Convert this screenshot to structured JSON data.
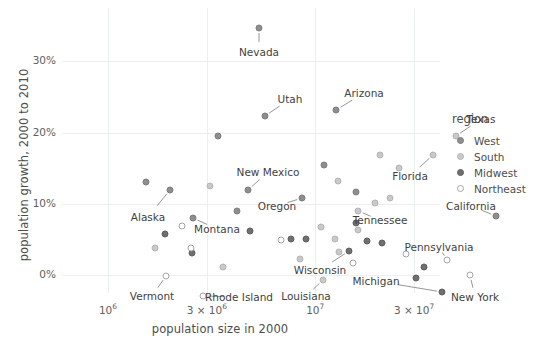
{
  "chart_data": {
    "type": "scatter",
    "title": "",
    "xlabel": "population size in 2000",
    "ylabel": "population growth, 2000 to 2010",
    "xscale": "log",
    "xlim": [
      600000,
      40000000
    ],
    "ylim": [
      -0.025,
      0.375
    ],
    "grid": true,
    "xticks": [
      {
        "value": 1000000,
        "label": "10",
        "exp": "6"
      },
      {
        "value": 3000000,
        "label": "3 × 10",
        "exp": "6"
      },
      {
        "value": 10000000,
        "label": "10",
        "exp": "7"
      },
      {
        "value": 30000000,
        "label": "3 × 10",
        "exp": "7"
      }
    ],
    "yticks": [
      {
        "value": 0.0,
        "label": "0%"
      },
      {
        "value": 0.1,
        "label": "10%"
      },
      {
        "value": 0.2,
        "label": "20%"
      },
      {
        "value": 0.3,
        "label": "30%"
      }
    ],
    "legend": {
      "title": "region",
      "position": "right",
      "entries": [
        {
          "label": "West",
          "color": "#8e8e8e",
          "key": "west"
        },
        {
          "label": "South",
          "color": "#c9c9c9",
          "key": "south"
        },
        {
          "label": "Midwest",
          "color": "#6f6f6f",
          "key": "midwest"
        },
        {
          "label": "Northeast",
          "color": "#ffffff",
          "key": "northeast"
        }
      ]
    },
    "points": [
      {
        "name": "Nevada",
        "region": "west",
        "px": 197,
        "py": 20,
        "labeled": true,
        "lx": 197,
        "ly": 44,
        "anchor": "center"
      },
      {
        "name": "Utah",
        "region": "west",
        "px": 203,
        "py": 108,
        "labeled": true,
        "lx": 228,
        "ly": 91,
        "anchor": "left"
      },
      {
        "name": "Arizona",
        "region": "west",
        "px": 274,
        "py": 102,
        "labeled": true,
        "lx": 302,
        "ly": 85,
        "anchor": "left"
      },
      {
        "name": "Texas",
        "region": "south",
        "px": 394,
        "py": 128,
        "labeled": true,
        "lx": 419,
        "ly": 111,
        "anchor": "left"
      },
      {
        "name": "Florida",
        "region": "south",
        "px": 371,
        "py": 147,
        "labeled": true,
        "lx": 348,
        "ly": 168,
        "anchor": "right"
      },
      {
        "name": "California",
        "region": "west",
        "px": 434,
        "py": 208,
        "labeled": true,
        "lx": 409,
        "ly": 198,
        "anchor": "right"
      },
      {
        "name": "New Mexico",
        "region": "west",
        "px": 186,
        "py": 182,
        "labeled": true,
        "lx": 206,
        "ly": 164,
        "anchor": "left"
      },
      {
        "name": "Oregon",
        "region": "west",
        "px": 240,
        "py": 190,
        "labeled": true,
        "lx": 215,
        "ly": 198,
        "anchor": "right"
      },
      {
        "name": "Tennessee",
        "region": "south",
        "px": 296,
        "py": 203,
        "labeled": true,
        "lx": 318,
        "ly": 212,
        "anchor": "left"
      },
      {
        "name": "Alaska",
        "region": "west",
        "px": 108,
        "py": 182,
        "labeled": true,
        "lx": 86,
        "ly": 209,
        "anchor": "center"
      },
      {
        "name": "Montana",
        "region": "west",
        "px": 131,
        "py": 210,
        "labeled": true,
        "lx": 155,
        "ly": 221,
        "anchor": "left"
      },
      {
        "name": "Pennsylvania",
        "region": "northeast",
        "px": 385,
        "py": 252,
        "labeled": true,
        "lx": 377,
        "ly": 239,
        "anchor": "left"
      },
      {
        "name": "Michigan",
        "region": "midwest",
        "px": 380,
        "py": 284,
        "labeled": true,
        "lx": 314,
        "ly": 273,
        "anchor": "center"
      },
      {
        "name": "New York",
        "region": "northeast",
        "px": 408,
        "py": 267,
        "labeled": true,
        "lx": 413,
        "ly": 289,
        "anchor": "left"
      },
      {
        "name": "Wisconsin",
        "region": "midwest",
        "px": 287,
        "py": 243,
        "labeled": true,
        "lx": 258,
        "ly": 262,
        "anchor": "center"
      },
      {
        "name": "Louisiana",
        "region": "south",
        "px": 261,
        "py": 272,
        "labeled": true,
        "lx": 244,
        "ly": 288,
        "anchor": "center"
      },
      {
        "name": "Rhode Island",
        "region": "northeast",
        "px": 141,
        "py": 288,
        "labeled": true,
        "lx": 177,
        "ly": 289,
        "anchor": "center"
      },
      {
        "name": "Vermont",
        "region": "northeast",
        "px": 104,
        "py": 268,
        "labeled": true,
        "lx": 90,
        "ly": 288,
        "anchor": "center"
      },
      {
        "name": "Idaho",
        "region": "west",
        "px": 156,
        "py": 128,
        "labeled": false
      },
      {
        "name": "Colorado",
        "region": "west",
        "px": 262,
        "py": 157,
        "labeled": false
      },
      {
        "name": "Georgia",
        "region": "south",
        "px": 337,
        "py": 160,
        "labeled": false
      },
      {
        "name": "North Carolina",
        "region": "south",
        "px": 318,
        "py": 147,
        "labeled": false
      },
      {
        "name": "South Carolina",
        "region": "south",
        "px": 276,
        "py": 173,
        "labeled": false
      },
      {
        "name": "Delaware",
        "region": "south",
        "px": 148,
        "py": 178,
        "labeled": false
      },
      {
        "name": "Washington",
        "region": "west",
        "px": 294,
        "py": 184,
        "labeled": false
      },
      {
        "name": "Virginia",
        "region": "south",
        "px": 328,
        "py": 190,
        "labeled": false
      },
      {
        "name": "Hawaii",
        "region": "west",
        "px": 175,
        "py": 203,
        "labeled": false
      },
      {
        "name": "Wyoming",
        "region": "west",
        "px": 84,
        "py": 174,
        "labeled": false
      },
      {
        "name": "North Dakota",
        "region": "midwest",
        "px": 103,
        "py": 226,
        "labeled": false
      },
      {
        "name": "South Dakota",
        "region": "midwest",
        "px": 130,
        "py": 245,
        "labeled": false
      },
      {
        "name": "Maryland",
        "region": "south",
        "px": 313,
        "py": 195,
        "labeled": false
      },
      {
        "name": "Oklahoma",
        "region": "south",
        "px": 296,
        "py": 222,
        "labeled": false
      },
      {
        "name": "Arkansas",
        "region": "south",
        "px": 259,
        "py": 219,
        "labeled": false
      },
      {
        "name": "Nebraska",
        "region": "midwest",
        "px": 188,
        "py": 223,
        "labeled": false
      },
      {
        "name": "Minnesota",
        "region": "midwest",
        "px": 294,
        "py": 215,
        "labeled": false
      },
      {
        "name": "Iowa",
        "region": "midwest",
        "px": 244,
        "py": 231,
        "labeled": false
      },
      {
        "name": "Kansas",
        "region": "midwest",
        "px": 229,
        "py": 231,
        "labeled": false
      },
      {
        "name": "Missouri",
        "region": "midwest",
        "px": 305,
        "py": 233,
        "labeled": false
      },
      {
        "name": "Indiana",
        "region": "midwest",
        "px": 320,
        "py": 235,
        "labeled": false
      },
      {
        "name": "Kentucky",
        "region": "south",
        "px": 273,
        "py": 231,
        "labeled": false
      },
      {
        "name": "Alabama",
        "region": "south",
        "px": 277,
        "py": 244,
        "labeled": false
      },
      {
        "name": "Mississippi",
        "region": "south",
        "px": 238,
        "py": 251,
        "labeled": false
      },
      {
        "name": "New Hampshire",
        "region": "northeast",
        "px": 120,
        "py": 218,
        "labeled": false
      },
      {
        "name": "Maine",
        "region": "northeast",
        "px": 129,
        "py": 240,
        "labeled": false
      },
      {
        "name": "Connecticut",
        "region": "northeast",
        "px": 219,
        "py": 232,
        "labeled": false
      },
      {
        "name": "New Jersey",
        "region": "northeast",
        "px": 344,
        "py": 246,
        "labeled": false
      },
      {
        "name": "Massachusetts",
        "region": "northeast",
        "px": 291,
        "py": 255,
        "labeled": false
      },
      {
        "name": "Illinois",
        "region": "midwest",
        "px": 362,
        "py": 259,
        "labeled": false
      },
      {
        "name": "Ohio",
        "region": "midwest",
        "px": 354,
        "py": 270,
        "labeled": false
      },
      {
        "name": "West Virginia",
        "region": "south",
        "px": 161,
        "py": 259,
        "labeled": false
      },
      {
        "name": "DC",
        "region": "south",
        "px": 93,
        "py": 240,
        "labeled": false
      }
    ],
    "connector_color": "#8a8a8a"
  }
}
